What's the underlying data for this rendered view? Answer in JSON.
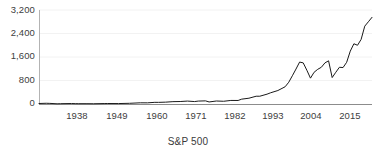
{
  "chart_data": {
    "type": "line",
    "title": "S&P 500",
    "xlabel": "",
    "ylabel": "",
    "grid": true,
    "legend": false,
    "legend_position": "none",
    "line_color": "#1a1a1a",
    "grid_color": "#f2f2f2",
    "axis_color": "#a6a6a6",
    "background": "#ffffff",
    "xlim": [
      1927,
      2019
    ],
    "ylim": [
      0,
      3200
    ],
    "yticks": [
      0,
      800,
      1600,
      2400,
      3200
    ],
    "ytick_labels": [
      "0",
      "800",
      "1,600",
      "2,400",
      "3,200"
    ],
    "xticks": [
      1938,
      1949,
      1960,
      1971,
      1982,
      1993,
      2004,
      2015
    ],
    "xtick_labels": [
      "1938",
      "1949",
      "1960",
      "1971",
      "1982",
      "1993",
      "2004",
      "2015"
    ],
    "series": [
      {
        "name": "S&P 500",
        "x": [
          1927,
          1929,
          1930,
          1932,
          1933,
          1936,
          1937,
          1938,
          1940,
          1942,
          1945,
          1946,
          1949,
          1952,
          1955,
          1957,
          1959,
          1960,
          1962,
          1964,
          1966,
          1968,
          1970,
          1971,
          1973,
          1974,
          1976,
          1978,
          1980,
          1982,
          1983,
          1985,
          1987,
          1988,
          1990,
          1991,
          1993,
          1995,
          1996,
          1997,
          1998,
          1999,
          2000,
          2001,
          2002,
          2003,
          2004,
          2005,
          2006,
          2007,
          2008,
          2009,
          2010,
          2011,
          2012,
          2013,
          2014,
          2015,
          2016,
          2017,
          2018,
          2019
        ],
        "values": [
          17,
          25,
          21,
          7,
          11,
          16,
          12,
          11,
          11,
          9,
          15,
          17,
          15,
          24,
          41,
          40,
          57,
          56,
          63,
          80,
          84,
          99,
          83,
          99,
          107,
          70,
          102,
          93,
          121,
          120,
          165,
          197,
          265,
          265,
          335,
          382,
          459,
          587,
          741,
          962,
          1190,
          1428,
          1400,
          1150,
          880,
          1080,
          1180,
          1250,
          1400,
          1470,
          900,
          1080,
          1250,
          1240,
          1420,
          1800,
          2050,
          2000,
          2200,
          2650,
          2800,
          2950
        ]
      }
    ]
  },
  "axes": {
    "y_axis_name": "value-axis",
    "x_axis_name": "year-axis"
  }
}
